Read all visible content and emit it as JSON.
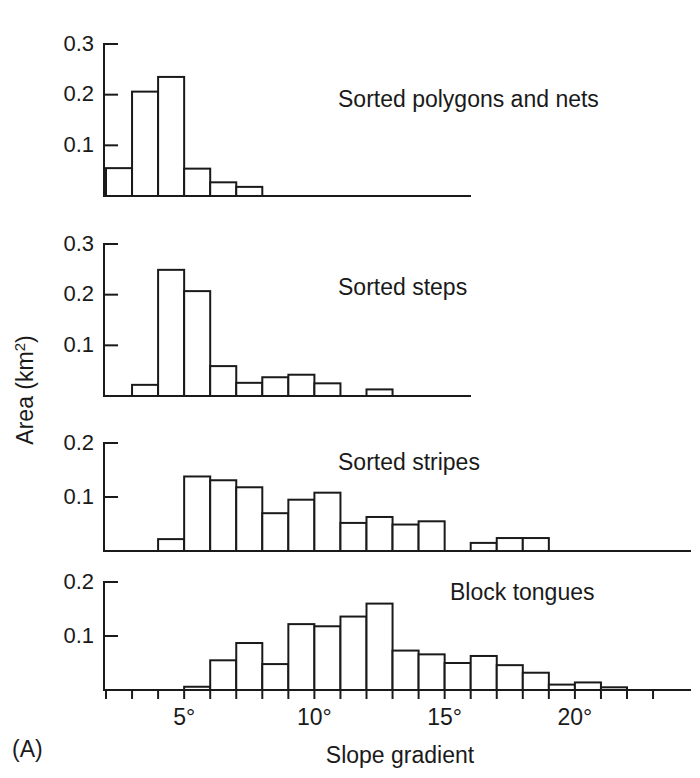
{
  "figure": {
    "panel_letter": "(A)",
    "xlabel": "Slope gradient",
    "ylabel_main": "Area (km",
    "ylabel_unit_sup": "2",
    "ylabel_close": ")"
  },
  "xaxis": {
    "ticks": [
      {
        "label": "5°",
        "value": 5
      },
      {
        "label": "10°",
        "value": 10
      },
      {
        "label": "15°",
        "value": 15
      },
      {
        "label": "20°",
        "value": 20
      }
    ],
    "minor_tick_step": 1,
    "range": [
      2,
      23
    ]
  },
  "chart_data": [
    {
      "type": "bar",
      "id": "sorted-polygons-and-nets",
      "title": "Sorted polygons and nets",
      "xlabel": "Slope gradient",
      "ylabel": "Area (km2)",
      "ylim": [
        0,
        0.3
      ],
      "ytick_labels": [
        "0.1",
        "0.2",
        "0.3"
      ],
      "ytick_values": [
        0.1,
        0.2,
        0.3
      ],
      "grid": false,
      "bin_width": 1,
      "bins": [
        {
          "x0": 2,
          "x1": 3,
          "value": 0.055
        },
        {
          "x0": 3,
          "x1": 4,
          "value": 0.206
        },
        {
          "x0": 4,
          "x1": 5,
          "value": 0.235
        },
        {
          "x0": 5,
          "x1": 6,
          "value": 0.054
        },
        {
          "x0": 6,
          "x1": 7,
          "value": 0.027
        },
        {
          "x0": 7,
          "x1": 8,
          "value": 0.018
        }
      ]
    },
    {
      "type": "bar",
      "id": "sorted-steps",
      "title": "Sorted steps",
      "xlabel": "Slope gradient",
      "ylabel": "Area (km2)",
      "ylim": [
        0,
        0.3
      ],
      "ytick_labels": [
        "0.1",
        "0.2",
        "0.3"
      ],
      "ytick_values": [
        0.1,
        0.2,
        0.3
      ],
      "grid": false,
      "bin_width": 1,
      "bins": [
        {
          "x0": 3,
          "x1": 4,
          "value": 0.022
        },
        {
          "x0": 4,
          "x1": 5,
          "value": 0.249
        },
        {
          "x0": 5,
          "x1": 6,
          "value": 0.207
        },
        {
          "x0": 6,
          "x1": 7,
          "value": 0.059
        },
        {
          "x0": 7,
          "x1": 8,
          "value": 0.026
        },
        {
          "x0": 8,
          "x1": 9,
          "value": 0.037
        },
        {
          "x0": 9,
          "x1": 10,
          "value": 0.042
        },
        {
          "x0": 10,
          "x1": 11,
          "value": 0.025
        },
        {
          "x0": 12,
          "x1": 13,
          "value": 0.013
        }
      ]
    },
    {
      "type": "bar",
      "id": "sorted-stripes",
      "title": "Sorted stripes",
      "xlabel": "Slope gradient",
      "ylabel": "Area (km2)",
      "ylim": [
        0,
        0.2
      ],
      "ytick_labels": [
        "0.1",
        "0.2"
      ],
      "ytick_values": [
        0.1,
        0.2
      ],
      "grid": false,
      "bin_width": 1,
      "bins": [
        {
          "x0": 4,
          "x1": 5,
          "value": 0.022
        },
        {
          "x0": 5,
          "x1": 6,
          "value": 0.138
        },
        {
          "x0": 6,
          "x1": 7,
          "value": 0.131
        },
        {
          "x0": 7,
          "x1": 8,
          "value": 0.118
        },
        {
          "x0": 8,
          "x1": 9,
          "value": 0.07
        },
        {
          "x0": 9,
          "x1": 10,
          "value": 0.095
        },
        {
          "x0": 10,
          "x1": 11,
          "value": 0.108
        },
        {
          "x0": 11,
          "x1": 12,
          "value": 0.052
        },
        {
          "x0": 12,
          "x1": 13,
          "value": 0.063
        },
        {
          "x0": 13,
          "x1": 14,
          "value": 0.049
        },
        {
          "x0": 14,
          "x1": 15,
          "value": 0.055
        },
        {
          "x0": 16,
          "x1": 17,
          "value": 0.015
        },
        {
          "x0": 17,
          "x1": 18,
          "value": 0.024
        },
        {
          "x0": 18,
          "x1": 19,
          "value": 0.024
        }
      ]
    },
    {
      "type": "bar",
      "id": "block-tongues",
      "title": "Block tongues",
      "xlabel": "Slope gradient",
      "ylabel": "Area (km2)",
      "ylim": [
        0,
        0.2
      ],
      "ytick_labels": [
        "0.1",
        "0.2"
      ],
      "ytick_values": [
        0.1,
        0.2
      ],
      "grid": false,
      "bin_width": 1,
      "bins": [
        {
          "x0": 5,
          "x1": 6,
          "value": 0.006
        },
        {
          "x0": 6,
          "x1": 7,
          "value": 0.055
        },
        {
          "x0": 7,
          "x1": 8,
          "value": 0.087
        },
        {
          "x0": 8,
          "x1": 9,
          "value": 0.048
        },
        {
          "x0": 9,
          "x1": 10,
          "value": 0.122
        },
        {
          "x0": 10,
          "x1": 11,
          "value": 0.118
        },
        {
          "x0": 11,
          "x1": 12,
          "value": 0.136
        },
        {
          "x0": 12,
          "x1": 13,
          "value": 0.16
        },
        {
          "x0": 13,
          "x1": 14,
          "value": 0.073
        },
        {
          "x0": 14,
          "x1": 15,
          "value": 0.066
        },
        {
          "x0": 15,
          "x1": 16,
          "value": 0.05
        },
        {
          "x0": 16,
          "x1": 17,
          "value": 0.063
        },
        {
          "x0": 17,
          "x1": 18,
          "value": 0.046
        },
        {
          "x0": 18,
          "x1": 19,
          "value": 0.032
        },
        {
          "x0": 19,
          "x1": 20,
          "value": 0.01
        },
        {
          "x0": 20,
          "x1": 21,
          "value": 0.014
        },
        {
          "x0": 21,
          "x1": 22,
          "value": 0.005
        }
      ]
    }
  ]
}
